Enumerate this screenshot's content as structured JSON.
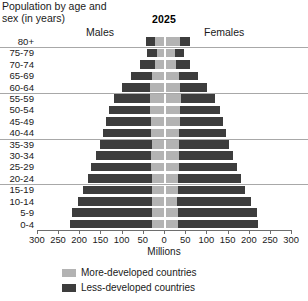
{
  "title": "Population by age and sex (in years)",
  "year": "2025",
  "side_labels": {
    "left": "Males",
    "right": "Females"
  },
  "axis_title": "Millions",
  "legend": [
    {
      "label": "More-developed countries",
      "color": "#b3b3b3",
      "key": "more"
    },
    {
      "label": "Less-developed countries",
      "color": "#3d3d3d",
      "key": "less"
    }
  ],
  "chart_data": {
    "type": "bar",
    "subtype": "population-pyramid",
    "title": "Population by age and sex (in years)",
    "subtitle": "2025",
    "xlabel": "Millions",
    "ylabel": "",
    "grid": false,
    "legend_position": "bottom",
    "xlim": [
      -300,
      300
    ],
    "xticks": [
      300,
      250,
      200,
      150,
      100,
      50,
      0,
      50,
      100,
      150,
      200,
      250,
      300
    ],
    "xtick_labels": [
      "300",
      "250",
      "200",
      "150",
      "100",
      "50",
      "0",
      "50",
      "100",
      "150",
      "200",
      "250",
      "300"
    ],
    "categories": [
      "80+",
      "75-79",
      "70-74",
      "65-69",
      "60-64",
      "55-59",
      "50-54",
      "45-49",
      "40-44",
      "35-39",
      "30-34",
      "25-29",
      "20-24",
      "15-19",
      "10-14",
      "5-9",
      "0-4"
    ],
    "series": [
      {
        "name": "Males, more-developed countries",
        "side": "left",
        "stack": "more",
        "values": [
          22,
          17,
          22,
          28,
          32,
          33,
          32,
          31,
          30,
          29,
          30,
          30,
          29,
          28,
          28,
          29,
          29
        ]
      },
      {
        "name": "Males, less-developed countries",
        "side": "left",
        "stack": "less",
        "values": [
          20,
          23,
          35,
          50,
          68,
          85,
          97,
          106,
          114,
          122,
          131,
          141,
          150,
          162,
          176,
          189,
          193
        ]
      },
      {
        "name": "Females, more-developed countries",
        "side": "right",
        "stack": "more",
        "values": [
          33,
          22,
          25,
          30,
          34,
          35,
          34,
          33,
          31,
          30,
          30,
          30,
          29,
          28,
          27,
          28,
          28
        ]
      },
      {
        "name": "Females, less-developed countries",
        "side": "right",
        "stack": "less",
        "values": [
          24,
          22,
          33,
          47,
          64,
          81,
          93,
          102,
          111,
          119,
          128,
          138,
          148,
          160,
          173,
          186,
          190
        ]
      }
    ],
    "separator_after_categories": [
      "80+",
      "60-64",
      "40-44",
      "20-24"
    ]
  },
  "scale": {
    "px_per_million": 0.424,
    "center_x_px": 127.2
  }
}
